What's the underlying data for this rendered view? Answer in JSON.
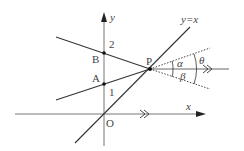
{
  "diagram": {
    "labels": {
      "y_axis": "y",
      "x_axis": "x",
      "origin": "O",
      "point_a": "A",
      "point_b": "B",
      "point_p": "P",
      "tick_1": "1",
      "tick_2": "2",
      "line_yx": "y=x",
      "alpha": "α",
      "beta": "β",
      "theta": "θ"
    },
    "colors": {
      "line": "#333333",
      "axis": "#555555"
    }
  }
}
